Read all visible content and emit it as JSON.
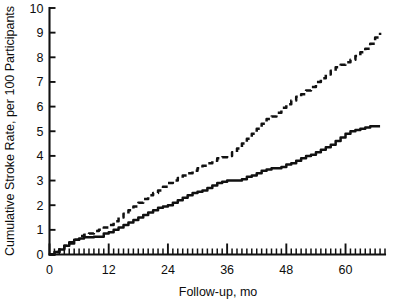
{
  "chart_data": {
    "type": "line",
    "title": "",
    "xlabel": "Follow-up, mo",
    "ylabel": "Cumulative Stroke Rate, per 100 Participants",
    "xlim": [
      0,
      68
    ],
    "ylim": [
      0,
      10
    ],
    "xticks": [
      0,
      12,
      24,
      36,
      48,
      60
    ],
    "xticklabels": [
      "0",
      "12",
      "24",
      "36",
      "48",
      "60"
    ],
    "yticks": [
      0,
      1,
      2,
      3,
      4,
      5,
      6,
      7,
      8,
      9,
      10
    ],
    "yticklabels": [
      "0",
      "1",
      "2",
      "3",
      "4",
      "5",
      "6",
      "7",
      "8",
      "9",
      "10"
    ],
    "minor_xtick_interval": 1,
    "grid": false,
    "legend": "none",
    "series": [
      {
        "name": "dashed-upper",
        "style": "dashed",
        "color": "#111111",
        "x": [
          0,
          1,
          2,
          3,
          4,
          5,
          6,
          7,
          8,
          9,
          10,
          11,
          12,
          13,
          14,
          15,
          16,
          17,
          18,
          19,
          20,
          21,
          22,
          23,
          24,
          25,
          26,
          27,
          28,
          29,
          30,
          31,
          32,
          33,
          34,
          35,
          36,
          37,
          38,
          39,
          40,
          41,
          42,
          43,
          44,
          45,
          46,
          47,
          48,
          49,
          50,
          51,
          52,
          53,
          54,
          55,
          56,
          57,
          58,
          59,
          60,
          61,
          62,
          63,
          64,
          65,
          66,
          67
        ],
        "y": [
          0.0,
          0.1,
          0.25,
          0.35,
          0.5,
          0.6,
          0.75,
          0.8,
          0.85,
          0.95,
          1.0,
          1.1,
          1.2,
          1.35,
          1.5,
          1.65,
          1.8,
          1.95,
          2.1,
          2.25,
          2.4,
          2.5,
          2.6,
          2.75,
          2.9,
          3.0,
          3.1,
          3.2,
          3.3,
          3.4,
          3.5,
          3.6,
          3.7,
          3.8,
          3.9,
          3.95,
          4.0,
          4.15,
          4.3,
          4.5,
          4.7,
          4.9,
          5.1,
          5.3,
          5.5,
          5.6,
          5.75,
          5.95,
          6.1,
          6.25,
          6.4,
          6.5,
          6.65,
          6.8,
          7.0,
          7.15,
          7.3,
          7.45,
          7.6,
          7.7,
          7.8,
          7.9,
          8.05,
          8.2,
          8.35,
          8.55,
          8.8,
          9.0
        ]
      },
      {
        "name": "solid-lower",
        "style": "solid",
        "color": "#111111",
        "x": [
          0,
          1,
          2,
          3,
          4,
          5,
          6,
          7,
          8,
          9,
          10,
          11,
          12,
          13,
          14,
          15,
          16,
          17,
          18,
          19,
          20,
          21,
          22,
          23,
          24,
          25,
          26,
          27,
          28,
          29,
          30,
          31,
          32,
          33,
          34,
          35,
          36,
          37,
          38,
          39,
          40,
          41,
          42,
          43,
          44,
          45,
          46,
          47,
          48,
          49,
          50,
          51,
          52,
          53,
          54,
          55,
          56,
          57,
          58,
          59,
          60,
          61,
          62,
          63,
          64,
          65,
          66,
          67
        ],
        "y": [
          0.0,
          0.1,
          0.2,
          0.35,
          0.45,
          0.6,
          0.65,
          0.7,
          0.7,
          0.72,
          0.72,
          0.85,
          0.9,
          1.0,
          1.1,
          1.2,
          1.3,
          1.4,
          1.5,
          1.6,
          1.7,
          1.8,
          1.9,
          1.95,
          2.0,
          2.1,
          2.2,
          2.3,
          2.4,
          2.5,
          2.55,
          2.6,
          2.7,
          2.8,
          2.9,
          2.95,
          3.0,
          3.0,
          3.0,
          3.05,
          3.15,
          3.2,
          3.3,
          3.4,
          3.45,
          3.5,
          3.5,
          3.55,
          3.65,
          3.7,
          3.8,
          3.9,
          4.0,
          4.05,
          4.15,
          4.25,
          4.35,
          4.45,
          4.6,
          4.75,
          4.9,
          5.0,
          5.05,
          5.1,
          5.15,
          5.2,
          5.2,
          5.2
        ]
      }
    ]
  },
  "axes": {
    "xlabel": "Follow-up, mo",
    "ylabel": "Cumulative Stroke Rate, per 100 Participants"
  }
}
